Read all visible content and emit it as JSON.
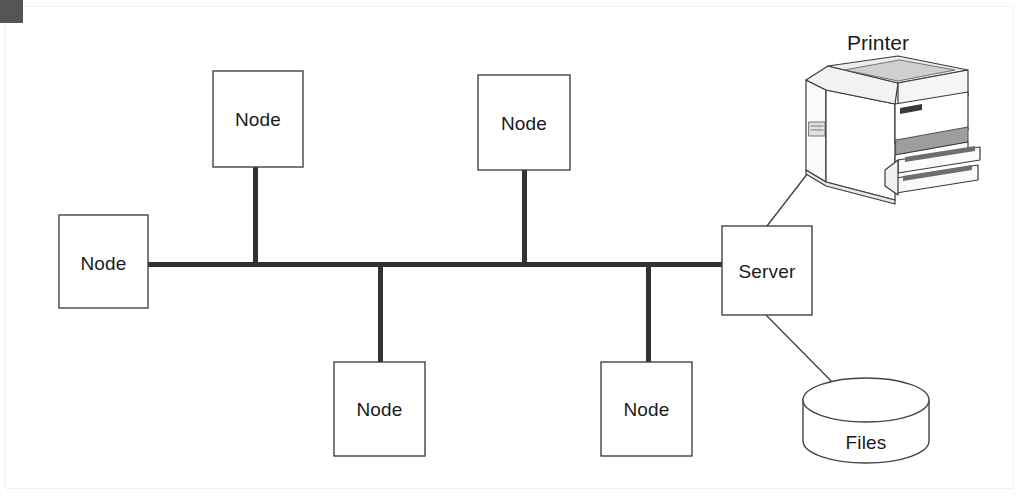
{
  "diagram": {
    "type": "network-topology",
    "topology_name": "bus",
    "background_color": "#ffffff",
    "line_color": "#333333",
    "bus": {
      "label": "network-bus",
      "x1": 148,
      "x2": 722,
      "y": 264,
      "thickness": 5
    },
    "corner_marker": {
      "color": "#555555",
      "width": 23,
      "height": 23
    },
    "nodes": [
      {
        "id": "node-left",
        "label": "Node",
        "x": 59,
        "y": 215,
        "width": 89,
        "height": 93,
        "position": "left",
        "stem": "horizontal"
      },
      {
        "id": "node-top-1",
        "label": "Node",
        "x": 213,
        "y": 71,
        "width": 90,
        "height": 96,
        "position": "top",
        "stem_x": 255
      },
      {
        "id": "node-top-2",
        "label": "Node",
        "x": 478,
        "y": 75,
        "width": 92,
        "height": 95,
        "position": "top",
        "stem_x": 524
      },
      {
        "id": "node-bottom-1",
        "label": "Node",
        "x": 334,
        "y": 362,
        "width": 91,
        "height": 94,
        "position": "bottom",
        "stem_x": 380
      },
      {
        "id": "node-bottom-2",
        "label": "Node",
        "x": 601,
        "y": 362,
        "width": 91,
        "height": 94,
        "position": "bottom",
        "stem_x": 648
      }
    ],
    "server": {
      "id": "server",
      "label": "Server",
      "x": 722,
      "y": 226,
      "width": 90,
      "height": 89
    },
    "printer": {
      "id": "printer",
      "label": "Printer",
      "label_x": 878,
      "label_y": 45,
      "image_x": 800,
      "image_y": 63,
      "image_width": 180,
      "image_height": 140
    },
    "storage": {
      "id": "files-storage",
      "label": "Files",
      "shape": "cylinder",
      "x": 803,
      "y": 384,
      "width": 126,
      "height": 81
    },
    "links": [
      {
        "from": "node-left",
        "to": "bus",
        "style": "thick"
      },
      {
        "from": "node-top-1",
        "to": "bus",
        "style": "thick"
      },
      {
        "from": "node-top-2",
        "to": "bus",
        "style": "thick"
      },
      {
        "from": "node-bottom-1",
        "to": "bus",
        "style": "thick"
      },
      {
        "from": "node-bottom-2",
        "to": "bus",
        "style": "thick"
      },
      {
        "from": "bus",
        "to": "server",
        "style": "thick"
      },
      {
        "from": "server",
        "to": "printer",
        "style": "thin"
      },
      {
        "from": "server",
        "to": "files-storage",
        "style": "thin"
      }
    ]
  }
}
